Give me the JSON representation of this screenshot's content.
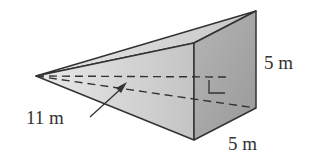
{
  "figure": {
    "type": "square-pyramid",
    "labels": {
      "slant_height": "11 m",
      "base_height": "5 m",
      "base_width": "5 m"
    },
    "right_angle_marker": true,
    "colors": {
      "left_face": "#d9d9d9",
      "top_face": "#cfcfcf",
      "base_face": "#a8a8a8",
      "edge": "#333333",
      "background": "#ffffff"
    }
  }
}
